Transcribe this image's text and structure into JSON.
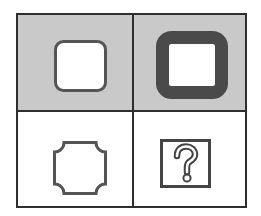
{
  "puzzle": {
    "type": "visual-analogy-2x2",
    "cells": [
      {
        "position": "top-left",
        "shaded": true,
        "shape": "rounded-square-thin-border",
        "label": ""
      },
      {
        "position": "top-right",
        "shaded": true,
        "shape": "rounded-square-thick-border",
        "label": ""
      },
      {
        "position": "bottom-left",
        "shaded": false,
        "shape": "concave-corner-square-thin-border",
        "label": ""
      },
      {
        "position": "bottom-right",
        "shaded": false,
        "shape": "question-box",
        "label": "?"
      }
    ],
    "question_mark": "?"
  },
  "colors": {
    "shade": "#c9c9c9",
    "line": "#2e2e2e",
    "thin_stroke": "#555555",
    "thick_stroke": "#4a4a4a",
    "fill": "#ffffff"
  }
}
